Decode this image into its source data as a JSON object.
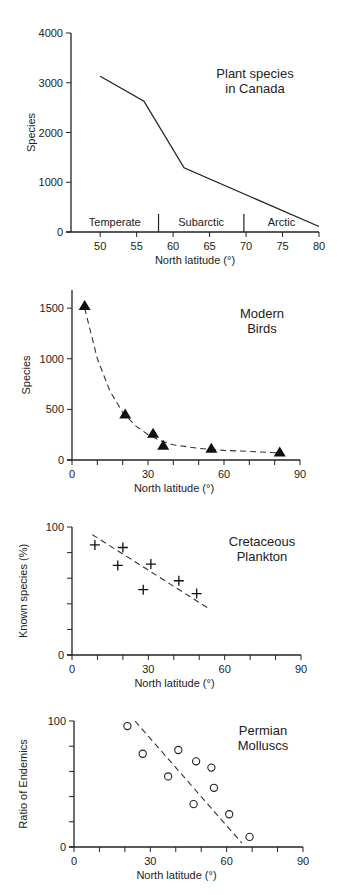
{
  "chart_data": [
    {
      "type": "line",
      "title": "Plant species in Canada",
      "title_lines": [
        "Plant species",
        "in Canada"
      ],
      "xlabel": "North latitude (°)",
      "ylabel": "Species",
      "xlim": [
        46,
        80
      ],
      "ylim": [
        0,
        4000
      ],
      "xticks": [
        50,
        55,
        60,
        65,
        70,
        75,
        80
      ],
      "yticks": [
        0,
        1000,
        2000,
        3000,
        4000
      ],
      "x": [
        50,
        56,
        61.5,
        80
      ],
      "y": [
        3130,
        2630,
        1290,
        110
      ],
      "zones": [
        {
          "label": "Temperate",
          "from": 46,
          "to": 58
        },
        {
          "label": "Subarctic",
          "from": 58,
          "to": 69.7
        },
        {
          "label": "Arctic",
          "from": 69.7,
          "to": 80
        }
      ],
      "grid": false
    },
    {
      "type": "scatter",
      "title": "Modern Birds",
      "title_lines": [
        "Modern",
        "Birds"
      ],
      "xlabel": "North latitude (°)",
      "ylabel": "Species",
      "xlim": [
        0,
        90
      ],
      "ylim": [
        0,
        1600
      ],
      "xticks": [
        0,
        30,
        60,
        90
      ],
      "yticks": [
        0,
        500,
        1000,
        1500
      ],
      "marker": "filled-triangle",
      "x": [
        5,
        21,
        32,
        36,
        55,
        82
      ],
      "y": [
        1520,
        450,
        260,
        140,
        110,
        75
      ],
      "trend": {
        "style": "dashed-curve",
        "x": [
          5,
          10,
          15,
          20,
          25,
          30,
          35,
          40,
          50,
          60,
          70,
          82
        ],
        "y": [
          1500,
          1000,
          680,
          470,
          340,
          250,
          190,
          150,
          115,
          95,
          85,
          70
        ]
      },
      "grid": false
    },
    {
      "type": "scatter",
      "title": "Cretaceous Plankton",
      "title_lines": [
        "Cretaceous",
        "Plankton"
      ],
      "xlabel": "North latitude (°)",
      "ylabel": "Known species (%)",
      "xlim": [
        0,
        90
      ],
      "ylim": [
        0,
        100
      ],
      "xticks": [
        0,
        30,
        60,
        90
      ],
      "yticks": [
        0,
        100
      ],
      "marker": "plus",
      "x": [
        9,
        18,
        20,
        28,
        31,
        42,
        49
      ],
      "y": [
        86,
        70,
        84,
        51,
        71,
        58,
        48
      ],
      "trend": {
        "style": "dashed-line",
        "x": [
          8,
          54
        ],
        "y": [
          94,
          36
        ]
      },
      "grid": false
    },
    {
      "type": "scatter",
      "title": "Permian Molluscs",
      "title_lines": [
        "Permian",
        "Molluscs"
      ],
      "xlabel": "North latitude (°)",
      "ylabel": "Ratio of Endemics",
      "xlim": [
        0,
        90
      ],
      "ylim": [
        0,
        100
      ],
      "xticks": [
        0,
        30,
        60,
        90
      ],
      "yticks": [
        0,
        100
      ],
      "marker": "open-circle",
      "x": [
        21,
        27,
        37,
        41,
        47,
        48,
        54,
        55,
        61,
        69
      ],
      "y": [
        96,
        74,
        56,
        77,
        34,
        68,
        63,
        47,
        26,
        8
      ],
      "trend": {
        "style": "dashed-line",
        "x": [
          24,
          66
        ],
        "y": [
          100,
          3
        ]
      },
      "grid": false
    }
  ]
}
